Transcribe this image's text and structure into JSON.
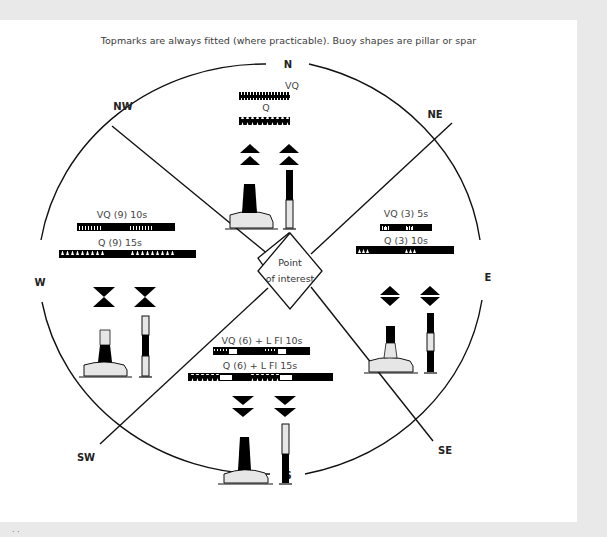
{
  "caption": "Topmarks are always fitted (where practicable). Buoy shapes are pillar or spar",
  "center_label": {
    "line1": "Point",
    "line2": "of interest"
  },
  "compass": {
    "N": "N",
    "NE": "NE",
    "E": "E",
    "SE": "SE",
    "S": "S",
    "SW": "SW",
    "W": "W",
    "NW": "NW"
  },
  "colors": {
    "black": "#000000",
    "yellow_fill": "#e6e6e6",
    "line": "#1a1a1a",
    "text": "#3a3a3a",
    "page_bg": "#e9e9e9",
    "card_bg": "#ffffff"
  },
  "sectors": {
    "north": {
      "light1": "VQ",
      "light2": "Q",
      "topmark": "two cones points up",
      "colouring": "black over yellow"
    },
    "east": {
      "light1": "VQ (3) 5s",
      "light2": "Q (3) 10s",
      "topmark": "two cones base to base",
      "colouring": "black with yellow band"
    },
    "south": {
      "light1": "VQ (6) + L Fl 10s",
      "light2": "Q (6) + L Fl 15s",
      "topmark": "two cones points down",
      "colouring": "yellow over black"
    },
    "west": {
      "light1": "VQ (9) 10s",
      "light2": "Q (9) 15s",
      "topmark": "two cones point to point",
      "colouring": "yellow with black band"
    }
  },
  "footer_stub": "· ·"
}
